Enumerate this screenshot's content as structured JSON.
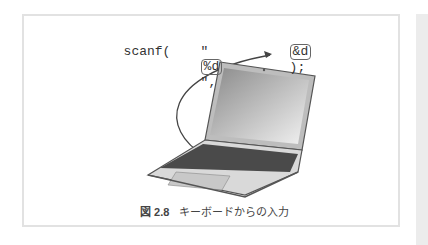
{
  "figure": {
    "code": {
      "func": "scanf(",
      "quote_open": "\"",
      "format": "%d",
      "quote_close": "\",",
      "arg": "&d",
      "end": ");"
    },
    "caption": {
      "label": "図 2.8",
      "text": "キーボードからの入力"
    },
    "illustration": "laptop-keyboard-input"
  }
}
